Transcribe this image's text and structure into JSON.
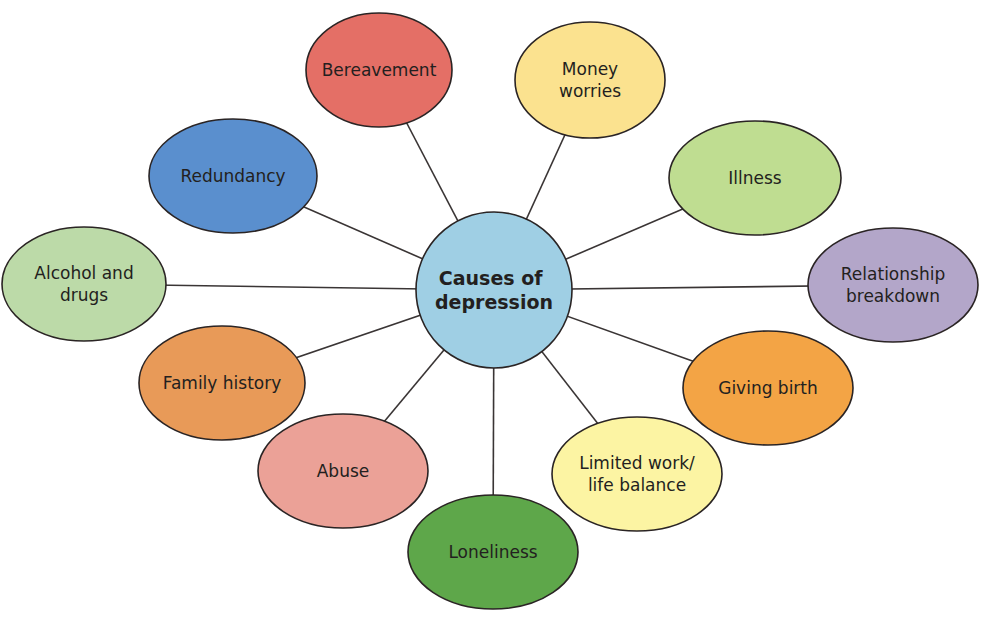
{
  "diagram": {
    "type": "mind-map",
    "center": {
      "lines": [
        "Causes of",
        "depression"
      ],
      "color": "#9fcfe4",
      "cx": 494,
      "cy": 290,
      "r": 78
    },
    "nodes": [
      {
        "id": "bereavement",
        "lines": [
          "Bereavement"
        ],
        "color": "#e46f66",
        "cx": 379,
        "cy": 70,
        "rx": 73,
        "ry": 57
      },
      {
        "id": "money-worries",
        "lines": [
          "Money",
          "worries"
        ],
        "color": "#fbe28f",
        "cx": 590,
        "cy": 80,
        "rx": 75,
        "ry": 58
      },
      {
        "id": "redundancy",
        "lines": [
          "Redundancy"
        ],
        "color": "#5a8fce",
        "cx": 233,
        "cy": 176,
        "rx": 84,
        "ry": 57
      },
      {
        "id": "illness",
        "lines": [
          "Illness"
        ],
        "color": "#bfdd91",
        "cx": 755,
        "cy": 178,
        "rx": 86,
        "ry": 57
      },
      {
        "id": "alcohol-and-drugs",
        "lines": [
          "Alcohol and",
          "drugs"
        ],
        "color": "#bcdaa8",
        "cx": 84,
        "cy": 284,
        "rx": 82,
        "ry": 57
      },
      {
        "id": "relationship-breakdown",
        "lines": [
          "Relationship",
          "breakdown"
        ],
        "color": "#b3a6c9",
        "cx": 893,
        "cy": 285,
        "rx": 85,
        "ry": 57
      },
      {
        "id": "family-history",
        "lines": [
          "Family history"
        ],
        "color": "#e89a58",
        "cx": 222,
        "cy": 383,
        "rx": 83,
        "ry": 57
      },
      {
        "id": "giving-birth",
        "lines": [
          "Giving birth"
        ],
        "color": "#f3a445",
        "cx": 768,
        "cy": 388,
        "rx": 85,
        "ry": 57
      },
      {
        "id": "abuse",
        "lines": [
          "Abuse"
        ],
        "color": "#eba197",
        "cx": 343,
        "cy": 471,
        "rx": 85,
        "ry": 57
      },
      {
        "id": "limited-work-life-balance",
        "lines": [
          "Limited work/",
          "life balance"
        ],
        "color": "#fcf4a3",
        "cx": 637,
        "cy": 474,
        "rx": 85,
        "ry": 57
      },
      {
        "id": "loneliness",
        "lines": [
          "Loneliness"
        ],
        "color": "#5ea74a",
        "cx": 493,
        "cy": 552,
        "rx": 85,
        "ry": 57
      }
    ]
  }
}
